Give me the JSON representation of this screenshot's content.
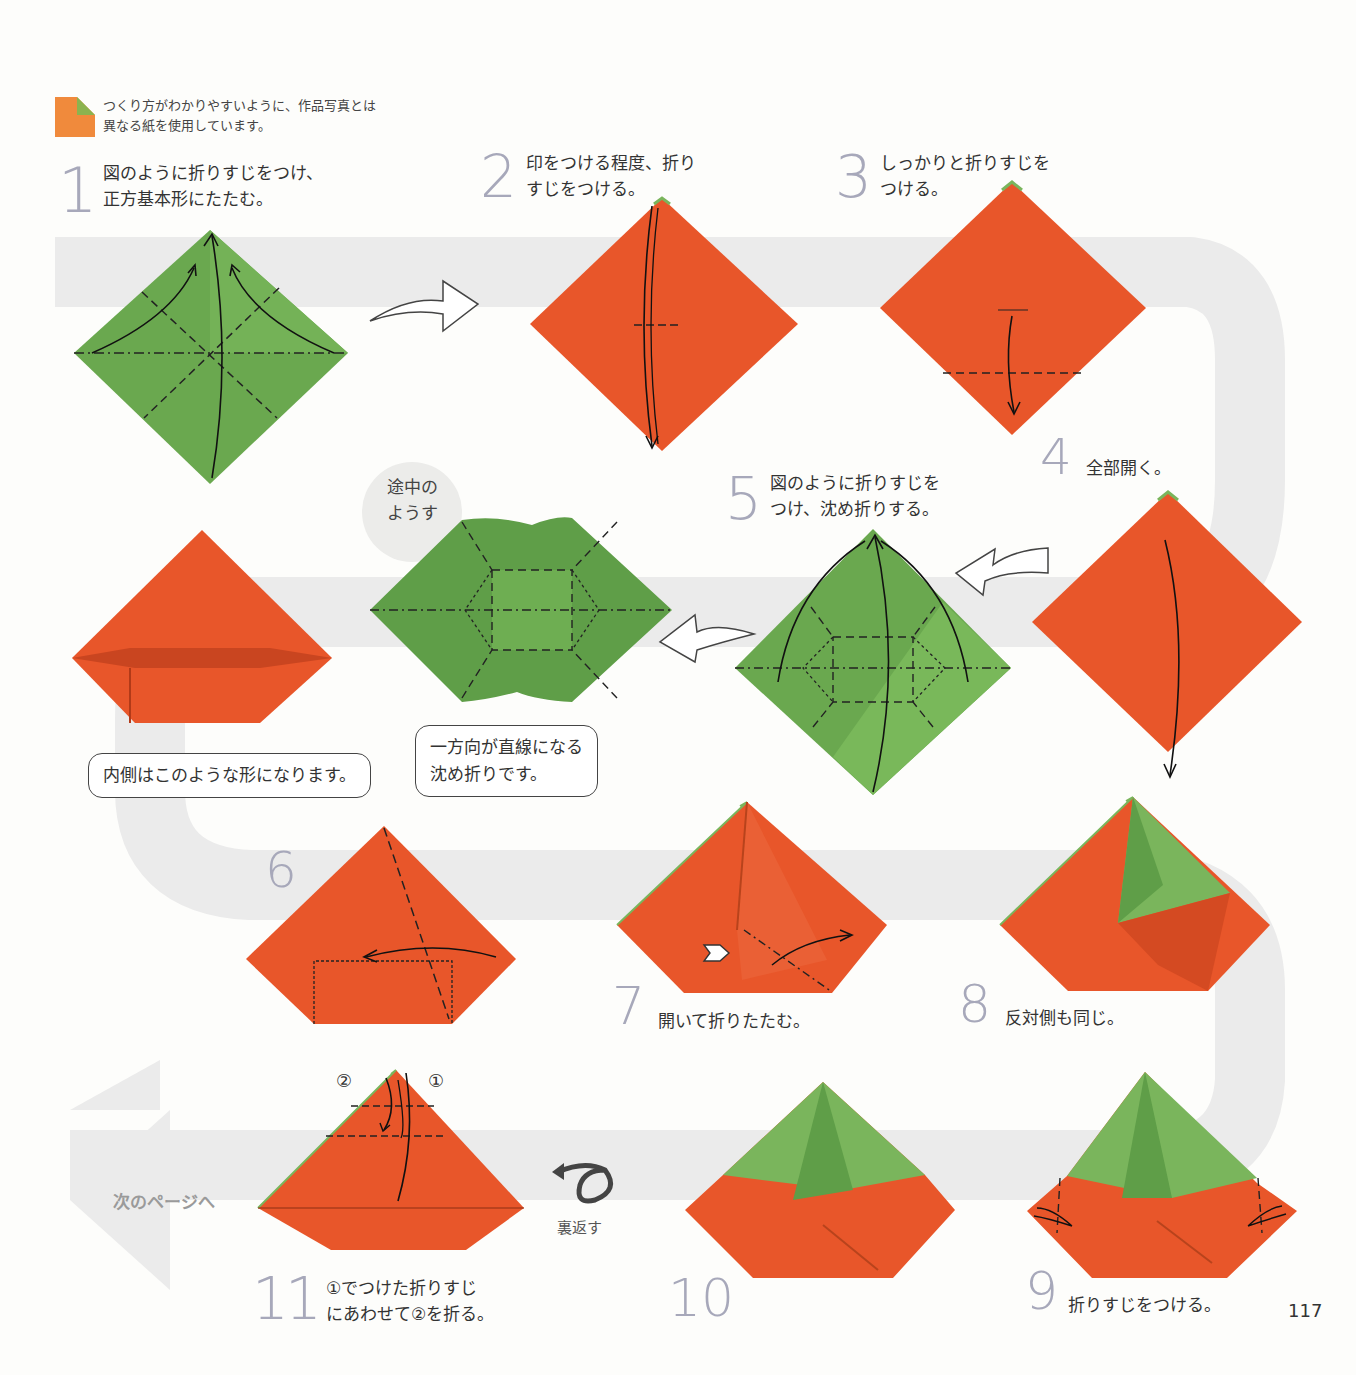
{
  "page": {
    "number": "117",
    "paper_note": "つくり方がわかりやすいように、作品写真とは\n異なる紙を使用しています。",
    "colors": {
      "orange": "#e8562a",
      "green": "#6aa84f",
      "path_gray": "#ededed",
      "step_number": "#a7a8ba"
    }
  },
  "steps": [
    {
      "num": "1",
      "text": "図のように折りすじをつけ、\n正方基本形にたたむ。"
    },
    {
      "num": "2",
      "text": "印をつける程度、折り\nすじをつける。"
    },
    {
      "num": "3",
      "text": "しっかりと折りすじを\nつける。"
    },
    {
      "num": "4",
      "text": "全部開く。"
    },
    {
      "num": "5",
      "text": "図のように折りすじを\nつけ、沈め折りする。"
    },
    {
      "num": "6",
      "text": ""
    },
    {
      "num": "7",
      "text": "開いて折りたたむ。"
    },
    {
      "num": "8",
      "text": "反対側も同じ。"
    },
    {
      "num": "9",
      "text": "折りすじをつける。"
    },
    {
      "num": "10",
      "text": ""
    },
    {
      "num": "11",
      "text": "①でつけた折りすじ\nにあわせて②を折る。"
    }
  ],
  "callouts": {
    "in_progress": "途中の\nようす",
    "inside_shape": "内側はこのような形になります。",
    "sink_fold": "一方向が直線になる\n沈め折りです。"
  },
  "markers": {
    "circle_1": "①",
    "circle_2": "②"
  },
  "navigation": {
    "next_page": "次のページへ",
    "flip_over": "裏返す"
  },
  "icons": [
    "paper-sample-icon",
    "flow-arrow-icon",
    "flip-over-icon",
    "push-arrow-icon"
  ]
}
